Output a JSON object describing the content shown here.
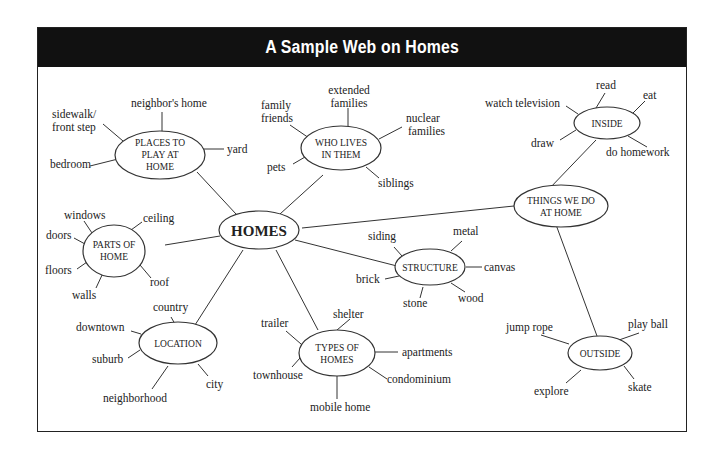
{
  "title": "A Sample Web on Homes",
  "center": {
    "label": "HOMES"
  },
  "categories": {
    "places": {
      "lines": [
        "PLACES TO",
        "PLAY AT",
        "HOME"
      ],
      "leaves": [
        "neighbor's home",
        "sidewalk/",
        "front step",
        "yard",
        "bedroom"
      ]
    },
    "who": {
      "lines": [
        "WHO LIVES",
        "IN THEM"
      ],
      "leaves": [
        "extended",
        "families",
        "family",
        "friends",
        "nuclear",
        "families",
        "pets",
        "siblings"
      ]
    },
    "things": {
      "lines": [
        "THINGS WE DO",
        "AT HOME"
      ]
    },
    "inside": {
      "label": "INSIDE",
      "leaves": [
        "read",
        "eat",
        "watch television",
        "draw",
        "do homework"
      ]
    },
    "outside": {
      "label": "OUTSIDE",
      "leaves": [
        "jump rope",
        "play ball",
        "explore",
        "skate"
      ]
    },
    "parts": {
      "lines": [
        "PARTS OF",
        "HOME"
      ],
      "leaves": [
        "windows",
        "ceiling",
        "doors",
        "floors",
        "roof",
        "walls"
      ]
    },
    "structure": {
      "label": "STRUCTURE",
      "leaves": [
        "siding",
        "metal",
        "canvas",
        "brick",
        "stone",
        "wood"
      ]
    },
    "location": {
      "label": "LOCATION",
      "leaves": [
        "country",
        "downtown",
        "suburb",
        "city",
        "neighborhood"
      ]
    },
    "types": {
      "lines": [
        "TYPES OF",
        "HOMES"
      ],
      "leaves": [
        "shelter",
        "trailer",
        "apartments",
        "townhouse",
        "condominium",
        "mobile home"
      ]
    }
  }
}
